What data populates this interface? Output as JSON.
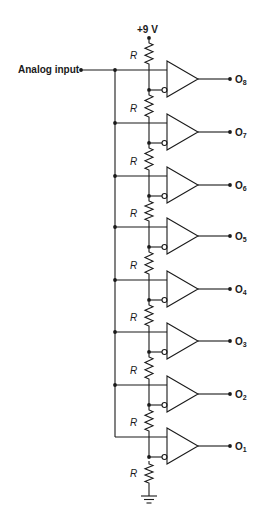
{
  "diagram": {
    "supply_label": "+9 V",
    "input_label": "Analog input",
    "resistor_label": "R",
    "output_prefix": "O",
    "stages": [
      {
        "output": "8",
        "y": 70
      },
      {
        "output": "7",
        "y": 123
      },
      {
        "output": "6",
        "y": 176
      },
      {
        "output": "5",
        "y": 227
      },
      {
        "output": "4",
        "y": 280
      },
      {
        "output": "3",
        "y": 332
      },
      {
        "output": "2",
        "y": 385
      },
      {
        "output": "1",
        "y": 437
      }
    ],
    "resistor_count": 9,
    "ground": "ground-symbol"
  }
}
